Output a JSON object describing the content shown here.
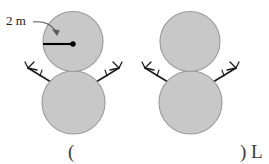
{
  "figure": {
    "background_color": "#ffffff",
    "snow_fill_color": "#c8c8c8",
    "snow_stroke_color": "#9a9a9a",
    "twig_color": "#1a1a1a",
    "annotation_color": "#1a1a1a",
    "caption_color": "#3a3a3a",
    "dimension_label": "2 m",
    "caption_left": "(",
    "caption_right": ") L",
    "snowmen": [
      {
        "name": "left-snowman",
        "annotated": true,
        "head": {
          "cx": 73,
          "cy": 41.5,
          "r": 30
        },
        "body": {
          "cx": 73.5,
          "cy": 102.5,
          "r": 31.5
        },
        "center_dot": {
          "cx": 73,
          "cy": 44,
          "r": 2.6
        },
        "radius_line": {
          "x1": 43,
          "y1": 44,
          "x2": 73,
          "y2": 44
        }
      },
      {
        "name": "right-snowman",
        "annotated": false,
        "head": {
          "cx": 190,
          "cy": 41.5,
          "r": 30
        },
        "body": {
          "cx": 190.5,
          "cy": 102.5,
          "r": 31.5
        }
      }
    ]
  }
}
